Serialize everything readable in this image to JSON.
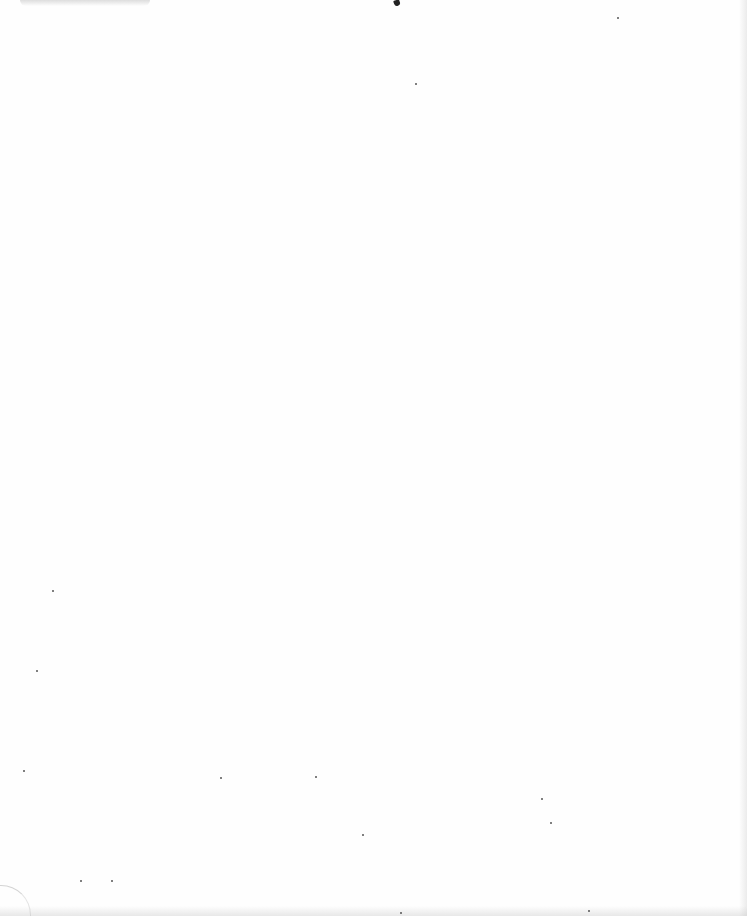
{
  "document": {
    "type": "blank scanned page",
    "text_content": ""
  },
  "artifacts": {
    "top_mark_color": "#222222",
    "speck_color": "#555555",
    "specks": [
      [
        220,
        777
      ],
      [
        315,
        776
      ],
      [
        362,
        834
      ],
      [
        541,
        798
      ],
      [
        550,
        822
      ],
      [
        617,
        17
      ],
      [
        415,
        83
      ],
      [
        52,
        590
      ],
      [
        36,
        670
      ],
      [
        400,
        912
      ],
      [
        588,
        910
      ],
      [
        111,
        880
      ],
      [
        80,
        880
      ],
      [
        23,
        770
      ]
    ]
  }
}
